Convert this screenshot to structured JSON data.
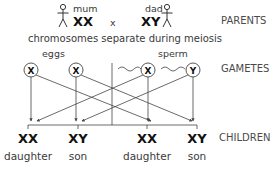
{
  "parents": {
    "mother_label": "mum",
    "mother_genotype": "XX",
    "cross_symbol": "x",
    "father_label": "dad",
    "father_genotype": "XY",
    "row_label": "PARENTS"
  },
  "meiosis_caption": "chromosomes separate during meiosis",
  "gametes": {
    "eggs_label": "eggs",
    "sperm_label": "sperm",
    "items": [
      {
        "chromosome": "X",
        "source": "egg"
      },
      {
        "chromosome": "X",
        "source": "egg"
      },
      {
        "chromosome": "X",
        "source": "sperm"
      },
      {
        "chromosome": "Y",
        "source": "sperm"
      }
    ],
    "row_label": "GAMETES"
  },
  "children": {
    "row_label": "CHILDREN",
    "items": [
      {
        "genotype": "XX",
        "sex": "daughter"
      },
      {
        "genotype": "XY",
        "sex": "son"
      },
      {
        "genotype": "XX",
        "sex": "daughter"
      },
      {
        "genotype": "XY",
        "sex": "son"
      }
    ]
  }
}
